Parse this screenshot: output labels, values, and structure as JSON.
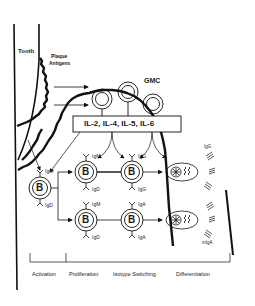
{
  "labels": {
    "tooth": "Tooth",
    "plaque_line1": "Plaque",
    "plaque_line2": "Antigens",
    "gmc": "GMC",
    "cytokines": "IL-2, IL-4, IL-5, IL-6"
  },
  "b_cells": {
    "activated": {
      "letter": "B",
      "top_ig": "IgM",
      "bottom_ig": "IgD"
    },
    "prolif_upper": {
      "letter": "B",
      "top_ig": "IgM",
      "bottom_ig": "IgD"
    },
    "prolif_lower": {
      "letter": "B",
      "top_ig": "IgM",
      "bottom_ig": "IgD"
    },
    "switch_upper": {
      "letter": "B",
      "top_ig": "IgG",
      "bottom_ig": "IgG"
    },
    "switch_lower": {
      "letter": "B",
      "top_ig": "IgA",
      "bottom_ig": "IgA"
    }
  },
  "plasma_cells": {
    "upper_product": "IgG",
    "lower_product": "mIgA"
  },
  "stages": [
    "Activation",
    "Proliferation",
    "Isotype Switching",
    "Differentiation"
  ],
  "colors": {
    "line": "#111111",
    "background": "#ffffff"
  }
}
